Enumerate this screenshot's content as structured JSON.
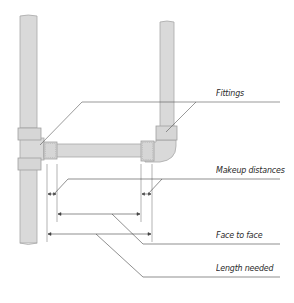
{
  "diagram": {
    "type": "pipe-measurement-illustration",
    "colors": {
      "pipe_fill": "#d9d9d9",
      "pipe_stroke": "#a8a8a8",
      "leader_line": "#555555",
      "text": "#2a2a2a"
    },
    "labels": {
      "fittings": "Fittings",
      "makeup_distances": "Makeup distances",
      "face_to_face": "Face to face",
      "length_needed": "Length needed"
    }
  }
}
